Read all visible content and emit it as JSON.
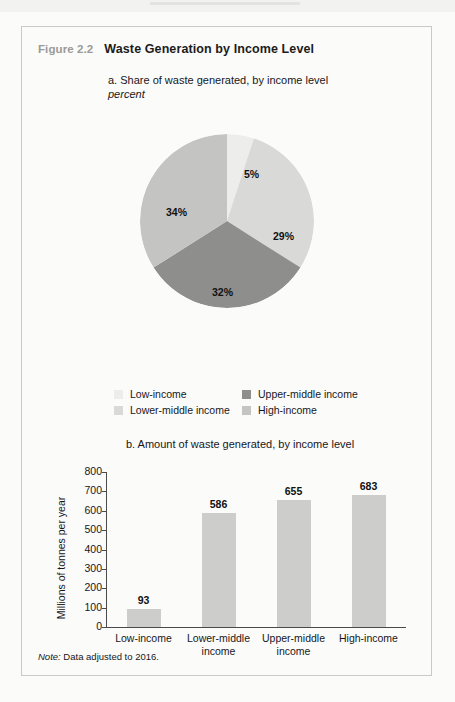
{
  "figure": {
    "number": "Figure 2.2",
    "title": "Waste Generation by Income Level",
    "note_label": "Note:",
    "note_text": " Data adjusted to 2016."
  },
  "panel_a": {
    "title": "a. Share of waste generated, by income level",
    "subtitle": "percent"
  },
  "panel_b": {
    "title": "b. Amount of waste generated, by income level"
  },
  "legend": {
    "items": [
      {
        "label": "Low-income",
        "color": "#ededeb"
      },
      {
        "label": "Upper-middle income",
        "color": "#8e8e8c"
      },
      {
        "label": "Lower-middle income",
        "color": "#d9d9d7"
      },
      {
        "label": "High-income",
        "color": "#c4c4c2"
      }
    ]
  },
  "colors": {
    "low_income": "#ededeb",
    "lower_middle": "#d9d9d7",
    "upper_middle": "#8e8e8c",
    "high_income": "#c4c4c2",
    "bar": "#cdcdcb",
    "axis": "#4a4a4a",
    "figure_number": "#9a9a98"
  },
  "chart_data": [
    {
      "type": "pie",
      "title": "a. Share of waste generated, by income level",
      "subtitle": "percent",
      "unit": "percent",
      "categories": [
        "Low-income",
        "Lower-middle income",
        "Upper-middle income",
        "High-income"
      ],
      "values": [
        5,
        29,
        32,
        34
      ],
      "labels": [
        "5%",
        "29%",
        "32%",
        "34%"
      ],
      "colors": [
        "#ededeb",
        "#d9d9d7",
        "#8e8e8c",
        "#c4c4c2"
      ],
      "start_angle_deg": 0,
      "direction": "clockwise",
      "legend_position": "bottom"
    },
    {
      "type": "bar",
      "title": "b. Amount of waste generated, by income level",
      "categories": [
        "Low-income",
        "Lower-middle income",
        "Upper-middle income",
        "High-income"
      ],
      "values": [
        93,
        586,
        655,
        683
      ],
      "data_labels": [
        "93",
        "586",
        "655",
        "683"
      ],
      "xlabel": "",
      "ylabel": "Millions of tonnes per year",
      "ylim": [
        0,
        800
      ],
      "yticks": [
        0,
        100,
        200,
        300,
        400,
        500,
        600,
        700,
        800
      ],
      "ytick_labels": [
        "0",
        "100",
        "200",
        "300",
        "400",
        "500",
        "600",
        "700",
        "800"
      ],
      "grid": false,
      "bar_color": "#cdcdcb"
    }
  ]
}
